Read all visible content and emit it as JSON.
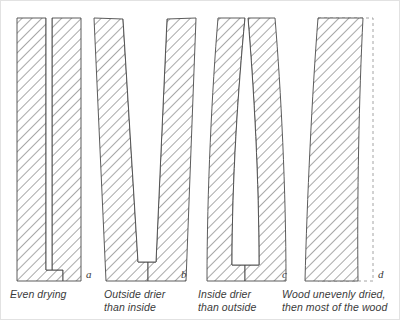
{
  "figure": {
    "colors": {
      "hatch": "#8a8a8a",
      "outline": "#4a4a4a",
      "dashed_outline": "#9a9a9a",
      "text": "#3a3a3a",
      "background": "#ffffff"
    },
    "hatch_angle_degrees": 45
  },
  "panels": [
    {
      "id": "a",
      "label": "a",
      "caption_lines": [
        "Even drying"
      ],
      "description": "Prongs remain straight and parallel; slot stays the same width",
      "has_slot": true,
      "has_dashed_reference": false
    },
    {
      "id": "b",
      "label": "b",
      "caption_lines": [
        "Outside drier",
        "than inside"
      ],
      "description": "Prongs splay outward, slot opens into a V at the top",
      "has_slot": true,
      "has_dashed_reference": false
    },
    {
      "id": "c",
      "label": "c",
      "caption_lines": [
        "Inside drier",
        "than outside"
      ],
      "description": "Prongs pinch inward and close at the top, bowing outward at the sides",
      "has_slot": true,
      "has_dashed_reference": false
    },
    {
      "id": "d",
      "label": "d",
      "caption_lines": [
        "Wood unevenly dried,",
        "then most of the wood"
      ],
      "description": "Solid sample bows sideways; dashed line marks the original straight edge",
      "has_slot": false,
      "has_dashed_reference": true
    }
  ]
}
